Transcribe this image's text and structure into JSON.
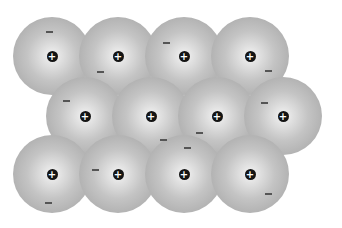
{
  "diagram": {
    "title": "",
    "ion_label": "+",
    "electron_label": "−",
    "atom_radius": 39,
    "colors": {
      "atom_edge": "#a8a8a8",
      "atom_center": "#f4f4f4",
      "nucleus": "#141414",
      "electron": "#555555",
      "background": "#ffffff"
    },
    "ions": [
      {
        "x": 52,
        "y": 56
      },
      {
        "x": 118,
        "y": 56
      },
      {
        "x": 184,
        "y": 56
      },
      {
        "x": 250,
        "y": 56
      },
      {
        "x": 85,
        "y": 116
      },
      {
        "x": 151,
        "y": 116
      },
      {
        "x": 217,
        "y": 116
      },
      {
        "x": 283,
        "y": 116
      },
      {
        "x": 52,
        "y": 174
      },
      {
        "x": 118,
        "y": 174
      },
      {
        "x": 184,
        "y": 174
      },
      {
        "x": 250,
        "y": 174
      }
    ],
    "electrons": [
      {
        "x": 49,
        "y": 31
      },
      {
        "x": 100,
        "y": 71
      },
      {
        "x": 166,
        "y": 42
      },
      {
        "x": 268,
        "y": 70
      },
      {
        "x": 66,
        "y": 100
      },
      {
        "x": 163,
        "y": 139
      },
      {
        "x": 199,
        "y": 132
      },
      {
        "x": 264,
        "y": 102
      },
      {
        "x": 95,
        "y": 169
      },
      {
        "x": 187,
        "y": 147
      },
      {
        "x": 48,
        "y": 202
      },
      {
        "x": 268,
        "y": 193
      }
    ]
  }
}
